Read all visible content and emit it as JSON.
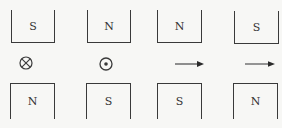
{
  "diagram": {
    "columns": [
      {
        "top_pole": "S",
        "bottom_pole": "N",
        "middle_symbol": "cross-in-circle",
        "middle_meaning": "current into page"
      },
      {
        "top_pole": "N",
        "bottom_pole": "S",
        "middle_symbol": "dot-in-circle",
        "middle_meaning": "current out of page"
      },
      {
        "top_pole": "N",
        "bottom_pole": "S",
        "middle_symbol": "arrow-right",
        "middle_meaning": "arrow pointing right"
      },
      {
        "top_pole": "S",
        "bottom_pole": "N",
        "middle_symbol": "arrow-right",
        "middle_meaning": "arrow pointing right"
      }
    ]
  },
  "colors": {
    "background": "#f7f7f5",
    "line": "#3a3a3a"
  }
}
